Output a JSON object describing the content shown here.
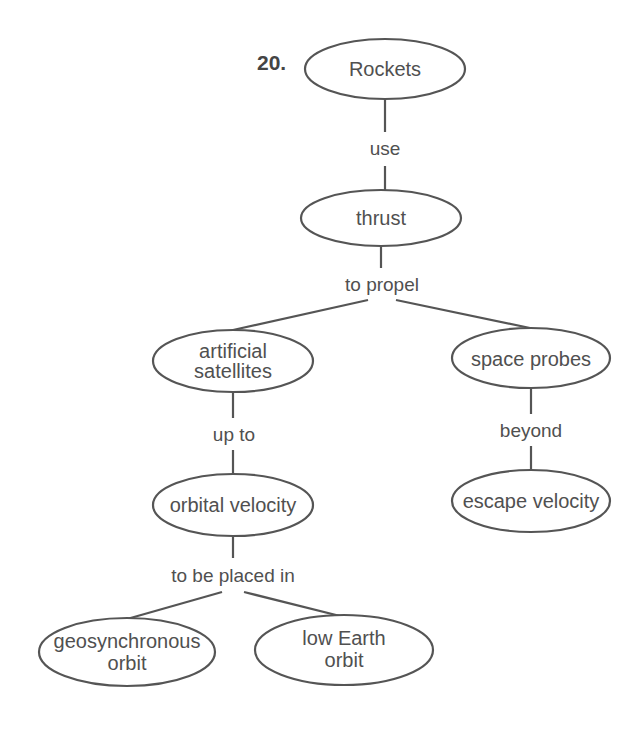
{
  "question_number": "20.",
  "concept_map": {
    "nodes": [
      {
        "id": "rockets",
        "lines": [
          "Rockets"
        ]
      },
      {
        "id": "thrust",
        "lines": [
          "thrust"
        ]
      },
      {
        "id": "artificial_satellites",
        "lines": [
          "artificial",
          "satellites"
        ]
      },
      {
        "id": "space_probes",
        "lines": [
          "space probes"
        ]
      },
      {
        "id": "orbital_velocity",
        "lines": [
          "orbital velocity"
        ]
      },
      {
        "id": "escape_velocity",
        "lines": [
          "escape velocity"
        ]
      },
      {
        "id": "geosynchronous_orbit",
        "lines": [
          "geosynchronous",
          "orbit"
        ]
      },
      {
        "id": "low_earth_orbit",
        "lines": [
          "low Earth",
          "orbit"
        ]
      }
    ],
    "links": [
      {
        "label": "use",
        "from": "rockets",
        "to": [
          "thrust"
        ]
      },
      {
        "label": "to propel",
        "from": "thrust",
        "to": [
          "artificial_satellites",
          "space_probes"
        ]
      },
      {
        "label": "up to",
        "from": "artificial_satellites",
        "to": [
          "orbital_velocity"
        ]
      },
      {
        "label": "beyond",
        "from": "space_probes",
        "to": [
          "escape_velocity"
        ]
      },
      {
        "label": "to be placed in",
        "from": "orbital_velocity",
        "to": [
          "geosynchronous_orbit",
          "low_earth_orbit"
        ]
      }
    ]
  }
}
